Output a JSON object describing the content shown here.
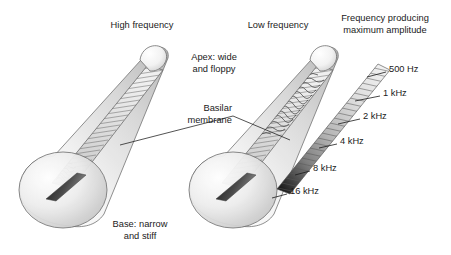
{
  "figure": {
    "background_color": "#ffffff",
    "width": 451,
    "height": 255
  },
  "headings": {
    "high_frequency": "High frequency",
    "low_frequency": "Low frequency",
    "frequency_map_line1": "Frequency producing",
    "frequency_map_line2": "maximum amplitude"
  },
  "annotations": {
    "apex_line1": "Apex: wide",
    "apex_line2": "and floppy",
    "basilar_line1": "Basilar",
    "basilar_line2": "membrane",
    "base_line1": "Base: narrow",
    "base_line2": "and stiff"
  },
  "frequency_scale": {
    "labels": [
      "500 Hz",
      "1 kHz",
      "2 kHz",
      "4 kHz",
      "8 kHz",
      "16 kHz"
    ],
    "label_positions": [
      {
        "text": "500 Hz",
        "x": 389,
        "y": 70,
        "tick_x1": 367,
        "tick_y1": 77,
        "tick_x2": 386,
        "tick_y2": 72
      },
      {
        "text": "1 kHz",
        "x": 383,
        "y": 94,
        "tick_x1": 355,
        "tick_y1": 101,
        "tick_x2": 380,
        "tick_y2": 96
      },
      {
        "text": "2 kHz",
        "x": 363,
        "y": 117,
        "tick_x1": 338,
        "tick_y1": 124,
        "tick_x2": 360,
        "tick_y2": 119
      },
      {
        "text": "4 kHz",
        "x": 340,
        "y": 142,
        "tick_x1": 319,
        "tick_y1": 148,
        "tick_x2": 337,
        "tick_y2": 144
      },
      {
        "text": "8 kHz",
        "x": 313,
        "y": 169,
        "tick_x1": 295,
        "tick_y1": 175,
        "tick_x2": 310,
        "tick_y2": 171
      },
      {
        "text": "16 kHz",
        "x": 290,
        "y": 192,
        "tick_x1": 272,
        "tick_y1": 198,
        "tick_x2": 287,
        "tick_y2": 194
      }
    ]
  },
  "colors": {
    "ink": "#1a1a1a",
    "outline": "#555555",
    "cone_light": "#fdfdfd",
    "cone_mid": "#c9c9c9",
    "cone_shadow": "#a8a8a8",
    "membrane_light": "#e8e8e8",
    "membrane_dark": "#4a4a4a",
    "strip_top": "#f0f0f0",
    "strip_bottom": "#0d0d0d",
    "hatch": "#6b6b6b"
  },
  "chart_data": {
    "type": "diagram",
    "scale_variable": "characteristic frequency",
    "scale_values": [
      500,
      1000,
      2000,
      4000,
      8000,
      16000
    ],
    "scale_units": [
      "Hz",
      "Hz",
      "Hz",
      "Hz",
      "Hz",
      "Hz"
    ],
    "scale_tick_labels": [
      "500 Hz",
      "1 kHz",
      "2 kHz",
      "4 kHz",
      "8 kHz",
      "16 kHz"
    ],
    "scale_direction": "apex (low frequency, top-right) to base (high frequency, bottom-left)",
    "panels": [
      {
        "name": "High frequency",
        "wave_peak_location": "base",
        "wave_peak_fraction_from_base": 0.2,
        "note": "Traveling wave envelope peaks near the narrow, stiff base"
      },
      {
        "name": "Low frequency",
        "wave_peak_location": "apex",
        "wave_peak_fraction_from_base": 0.85,
        "note": "Traveling wave envelope peaks near the wide, floppy apex"
      },
      {
        "name": "Frequency producing maximum amplitude",
        "wave_peak_location": "none",
        "note": "Isolated basilar membrane strip annotated with characteristic frequencies"
      }
    ]
  }
}
